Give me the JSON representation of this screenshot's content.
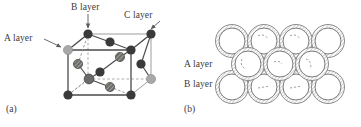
{
  "figure": {
    "panel_a": {
      "caption": "(a)",
      "labels": {
        "a_layer": "A layer",
        "b_layer": "B layer",
        "c_layer": "C layer"
      },
      "structure": "face-centred cubic unit cell",
      "colors": {
        "atom_dark": "#3a3a3a",
        "atom_light": "#a8a8a8",
        "atom_hatched": "#55554f",
        "edge_solid": "#4a4a4a",
        "edge_hidden": "#9a9a9a",
        "bond": "#4a4a4a"
      },
      "cube_vertices": {
        "front_bottom_left": [
          68,
          95
        ],
        "front_bottom_right": [
          131,
          95
        ],
        "front_top_left": [
          68,
          50
        ],
        "front_top_right": [
          131,
          50
        ],
        "back_bottom_left": [
          88,
          79
        ],
        "back_bottom_right": [
          151,
          79
        ],
        "back_top_left": [
          88,
          34
        ],
        "back_top_right": [
          151,
          34
        ]
      },
      "atoms": [
        {
          "id": "corner-front-bottom-left",
          "x": 68,
          "y": 95,
          "r": 4.6,
          "shade": "dark"
        },
        {
          "id": "corner-front-bottom-right",
          "x": 131,
          "y": 95,
          "r": 4.6,
          "shade": "dark"
        },
        {
          "id": "corner-front-top-left",
          "x": 68,
          "y": 50,
          "r": 4.6,
          "shade": "light"
        },
        {
          "id": "corner-front-top-right",
          "x": 131,
          "y": 50,
          "r": 4.6,
          "shade": "dark"
        },
        {
          "id": "corner-back-bottom-right",
          "x": 151,
          "y": 79,
          "r": 4.6,
          "shade": "light"
        },
        {
          "id": "corner-back-top-left",
          "x": 88,
          "y": 34,
          "r": 4.6,
          "shade": "dark"
        },
        {
          "id": "corner-back-top-right",
          "x": 151,
          "y": 34,
          "r": 4.6,
          "shade": "dark"
        },
        {
          "id": "face-top",
          "x": 110,
          "y": 42,
          "r": 4.6,
          "shade": "dark"
        },
        {
          "id": "face-front",
          "x": 100,
          "y": 72,
          "r": 4.6,
          "shade": "dark"
        },
        {
          "id": "face-left",
          "x": 78,
          "y": 64,
          "r": 4.6,
          "shade": "hatched"
        },
        {
          "id": "face-right",
          "x": 141,
          "y": 64,
          "r": 4.6,
          "shade": "dark"
        },
        {
          "id": "face-back",
          "x": 120,
          "y": 57,
          "r": 4.6,
          "shade": "hatched"
        },
        {
          "id": "face-bottom",
          "x": 110,
          "y": 87,
          "r": 4.6,
          "shade": "hatched"
        },
        {
          "id": "body-centre",
          "x": 89,
          "y": 79,
          "r": 4.8,
          "shade": "mid"
        }
      ],
      "arrows": [
        {
          "id": "arrow-a-layer",
          "x1": 44,
          "y1": 39,
          "x2": 62,
          "y2": 48,
          "label": "A layer"
        },
        {
          "id": "arrow-b-layer",
          "x1": 88,
          "y1": 14,
          "x2": 88,
          "y2": 29,
          "label": "B layer"
        },
        {
          "id": "arrow-c-layer",
          "x1": 160,
          "y1": 22,
          "x2": 150,
          "y2": 30,
          "label": "C layer"
        }
      ]
    },
    "panel_b": {
      "caption": "(b)",
      "labels": {
        "a_layer": "A layer",
        "b_layer": "B layer"
      },
      "structure": "close-packed spheres, three stacked rows",
      "colors": {
        "ring_outer": "#8e8e8e",
        "ring_inner": "#7a7a7a",
        "ring_fill": "#ffffff",
        "hatch": "#b3b3b3",
        "dash": "#6f6f6f"
      },
      "rows": [
        {
          "id": "row-top",
          "layer": "C",
          "count": 4,
          "cx": [
            52,
            84,
            116,
            148
          ],
          "cy": 41
        },
        {
          "id": "row-middle",
          "layer": "A",
          "count": 3,
          "cx": [
            68,
            100,
            132
          ],
          "cy": 64
        },
        {
          "id": "row-bottom",
          "layer": "B",
          "count": 4,
          "cx": [
            52,
            84,
            116,
            148
          ],
          "cy": 87
        }
      ],
      "sphere": {
        "r_outer": 16.5,
        "r_inner": 13.0
      }
    }
  }
}
